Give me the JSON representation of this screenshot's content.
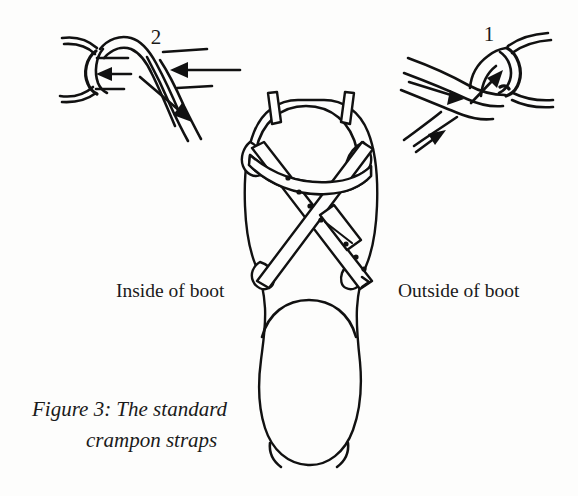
{
  "figure": {
    "domain_kind": "line-art technical illustration",
    "background_color": "#fdfdfc",
    "ink_color": "#111111",
    "caption": {
      "line1": "Figure 3: The standard",
      "line2": "crampon straps"
    },
    "labels": {
      "inside_of_boot": "Inside of boot",
      "outside_of_boot": "Outside of boot"
    },
    "insets": [
      {
        "number": "2",
        "position": "top-left",
        "description": "strap threaded back through ring, arrows showing pull direction"
      },
      {
        "number": "1",
        "position": "top-right",
        "description": "strap passing up through ring, arrows showing feed direction"
      }
    ],
    "main_diagram": {
      "name": "boot-sole-with-crampon-straps",
      "parts": [
        "boot-outline",
        "heel-strap",
        "crossing-strap-left",
        "crossing-strap-right",
        "buckle",
        "strap-holes",
        "rear-posts",
        "side-rings"
      ]
    }
  }
}
